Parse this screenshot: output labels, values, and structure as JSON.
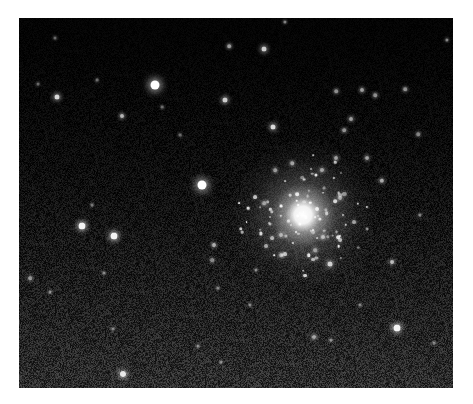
{
  "image": {
    "subject": "globular star cluster on dark sky background",
    "frame": {
      "x": 19,
      "y": 18,
      "width": 434,
      "height": 370
    },
    "colors": {
      "page_background": "#ffffff",
      "sky_top": "#020202",
      "sky_bottom": "#2a2a2a",
      "star": "#ffffff"
    },
    "cluster_core": {
      "x": 303,
      "y": 215,
      "radius": 55
    },
    "stars": [
      {
        "x": 155,
        "y": 85,
        "r": 4.5,
        "b": 1.0
      },
      {
        "x": 202,
        "y": 185,
        "r": 4.5,
        "b": 1.0
      },
      {
        "x": 82,
        "y": 226,
        "r": 3.5,
        "b": 0.95
      },
      {
        "x": 114,
        "y": 236,
        "r": 3.5,
        "b": 0.95
      },
      {
        "x": 57,
        "y": 97,
        "r": 2.5,
        "b": 0.85
      },
      {
        "x": 225,
        "y": 100,
        "r": 2.5,
        "b": 0.8
      },
      {
        "x": 122,
        "y": 116,
        "r": 2.0,
        "b": 0.7
      },
      {
        "x": 273,
        "y": 127,
        "r": 2.5,
        "b": 0.85
      },
      {
        "x": 264,
        "y": 49,
        "r": 2.5,
        "b": 0.8
      },
      {
        "x": 229,
        "y": 46,
        "r": 1.8,
        "b": 0.6
      },
      {
        "x": 397,
        "y": 328,
        "r": 3.5,
        "b": 0.95
      },
      {
        "x": 123,
        "y": 374,
        "r": 3.0,
        "b": 0.9
      },
      {
        "x": 330,
        "y": 264,
        "r": 2.5,
        "b": 0.8
      },
      {
        "x": 392,
        "y": 262,
        "r": 2.0,
        "b": 0.7
      },
      {
        "x": 214,
        "y": 245,
        "r": 2.0,
        "b": 0.65
      },
      {
        "x": 362,
        "y": 90,
        "r": 2.0,
        "b": 0.6
      },
      {
        "x": 336,
        "y": 91,
        "r": 1.8,
        "b": 0.55
      },
      {
        "x": 375,
        "y": 95,
        "r": 1.8,
        "b": 0.55
      },
      {
        "x": 351,
        "y": 119,
        "r": 2.0,
        "b": 0.6
      },
      {
        "x": 405,
        "y": 89,
        "r": 1.8,
        "b": 0.55
      },
      {
        "x": 344,
        "y": 130,
        "r": 1.8,
        "b": 0.55
      },
      {
        "x": 418,
        "y": 134,
        "r": 1.8,
        "b": 0.5
      },
      {
        "x": 367,
        "y": 158,
        "r": 2.0,
        "b": 0.6
      },
      {
        "x": 382,
        "y": 181,
        "r": 2.2,
        "b": 0.65
      },
      {
        "x": 336,
        "y": 158,
        "r": 2.0,
        "b": 0.6
      },
      {
        "x": 292,
        "y": 163,
        "r": 1.8,
        "b": 0.6
      },
      {
        "x": 275,
        "y": 170,
        "r": 1.8,
        "b": 0.55
      },
      {
        "x": 322,
        "y": 170,
        "r": 2.0,
        "b": 0.6
      },
      {
        "x": 340,
        "y": 198,
        "r": 2.0,
        "b": 0.6
      },
      {
        "x": 264,
        "y": 203,
        "r": 1.8,
        "b": 0.55
      },
      {
        "x": 323,
        "y": 237,
        "r": 2.0,
        "b": 0.65
      },
      {
        "x": 281,
        "y": 255,
        "r": 1.8,
        "b": 0.55
      },
      {
        "x": 282,
        "y": 255,
        "r": 1.5,
        "b": 0.5
      },
      {
        "x": 315,
        "y": 250,
        "r": 1.8,
        "b": 0.55
      },
      {
        "x": 281,
        "y": 235,
        "r": 2.0,
        "b": 0.6
      },
      {
        "x": 256,
        "y": 270,
        "r": 1.6,
        "b": 0.5
      },
      {
        "x": 314,
        "y": 337,
        "r": 2.0,
        "b": 0.6
      },
      {
        "x": 331,
        "y": 340,
        "r": 1.6,
        "b": 0.5
      },
      {
        "x": 360,
        "y": 305,
        "r": 1.6,
        "b": 0.45
      },
      {
        "x": 30,
        "y": 278,
        "r": 1.8,
        "b": 0.55
      },
      {
        "x": 50,
        "y": 292,
        "r": 1.6,
        "b": 0.5
      },
      {
        "x": 104,
        "y": 273,
        "r": 1.6,
        "b": 0.5
      },
      {
        "x": 212,
        "y": 260,
        "r": 1.8,
        "b": 0.5
      },
      {
        "x": 218,
        "y": 288,
        "r": 1.6,
        "b": 0.45
      },
      {
        "x": 113,
        "y": 329,
        "r": 1.5,
        "b": 0.45
      },
      {
        "x": 198,
        "y": 346,
        "r": 1.6,
        "b": 0.5
      },
      {
        "x": 221,
        "y": 362,
        "r": 1.5,
        "b": 0.45
      },
      {
        "x": 38,
        "y": 84,
        "r": 1.5,
        "b": 0.4
      },
      {
        "x": 97,
        "y": 80,
        "r": 1.4,
        "b": 0.4
      },
      {
        "x": 285,
        "y": 22,
        "r": 1.6,
        "b": 0.5
      },
      {
        "x": 162,
        "y": 107,
        "r": 1.4,
        "b": 0.4
      },
      {
        "x": 180,
        "y": 135,
        "r": 1.4,
        "b": 0.4
      },
      {
        "x": 434,
        "y": 343,
        "r": 1.5,
        "b": 0.45
      },
      {
        "x": 92,
        "y": 205,
        "r": 1.5,
        "b": 0.45
      },
      {
        "x": 250,
        "y": 305,
        "r": 1.5,
        "b": 0.45
      },
      {
        "x": 420,
        "y": 215,
        "r": 1.6,
        "b": 0.5
      },
      {
        "x": 447,
        "y": 40,
        "r": 1.6,
        "b": 0.5
      },
      {
        "x": 55,
        "y": 38,
        "r": 1.5,
        "b": 0.4
      }
    ]
  }
}
